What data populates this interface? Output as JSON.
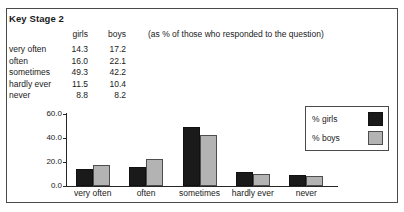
{
  "document": {
    "title": "Key Stage 2",
    "note": "(as % of those who responded to the question)"
  },
  "table": {
    "columns": [
      "",
      "girls",
      "boys"
    ],
    "header_girls": "girls",
    "header_boys": "boys",
    "rows": [
      {
        "label": "very often",
        "girls": "14.3",
        "boys": "17.2"
      },
      {
        "label": "often",
        "girls": "16.0",
        "boys": "22.1"
      },
      {
        "label": "sometimes",
        "girls": "49.3",
        "boys": "42.2"
      },
      {
        "label": "hardly ever",
        "girls": "11.5",
        "boys": "10.4"
      },
      {
        "label": "never",
        "girls": "8.8",
        "boys": "8.2"
      }
    ]
  },
  "legend": {
    "items": [
      {
        "label": "% girls",
        "color": "#1a1a1a"
      },
      {
        "label": "% boys",
        "color": "#b3b3b3"
      }
    ]
  },
  "chart_data": {
    "type": "bar",
    "title": "",
    "xlabel": "",
    "ylabel": "",
    "categories": [
      "very often",
      "often",
      "sometimes",
      "hardly ever",
      "never"
    ],
    "series": [
      {
        "name": "% girls",
        "color": "#1a1a1a",
        "values": [
          14.3,
          16.0,
          49.3,
          11.5,
          8.8
        ]
      },
      {
        "name": "% boys",
        "color": "#b3b3b3",
        "values": [
          17.2,
          22.1,
          42.2,
          10.4,
          8.2
        ]
      }
    ],
    "ylim": [
      0,
      60
    ],
    "yticks": [
      0.0,
      20.0,
      40.0,
      60.0
    ],
    "ytick_labels": [
      "0.0",
      "20.0",
      "40.0",
      "60.0"
    ],
    "grid": false,
    "legend_position": "right"
  }
}
